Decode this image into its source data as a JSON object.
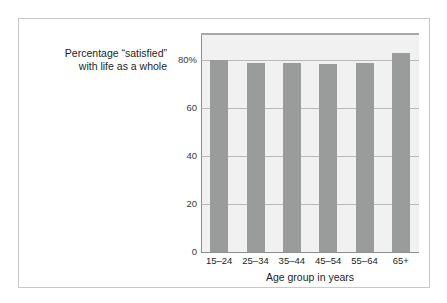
{
  "figure": {
    "frame_color": "#c9c9c9",
    "panel_color": "#f1f1f1",
    "bar_color": "#9a9b9b",
    "gridline_color": "#b9b9b9",
    "axis_color": "#8d8d8d",
    "text_color": "#231f20"
  },
  "chart_data": {
    "type": "bar",
    "title": "",
    "xlabel": "Age group in years",
    "ylabel": "Percentage “satisfied”\nwith life as a whole",
    "categories": [
      "15–24",
      "25–34",
      "35–44",
      "45–54",
      "55–64",
      "65+"
    ],
    "values": [
      80,
      79,
      79,
      78.5,
      79,
      83
    ],
    "ylim": [
      0,
      91
    ],
    "yticks": [
      0,
      20,
      40,
      60,
      80
    ],
    "ytick_labels": [
      "0",
      "20",
      "40",
      "60",
      "80%"
    ],
    "grid": true,
    "legend": false
  }
}
